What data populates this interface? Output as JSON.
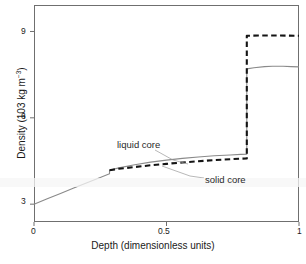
{
  "chart_data": {
    "type": "line",
    "title": "",
    "xlabel": "Depth (dimensionless units)",
    "ylabel_text": "Density (103 kg m",
    "ylabel_sup": "−3",
    "ylabel_tail": ")",
    "ylabel_full": "Density (103 kg m−3)",
    "xlim": [
      0,
      1
    ],
    "ylim": [
      2.38,
      9.92
    ],
    "xticks": [
      "0",
      "0.5",
      "1"
    ],
    "xtick_values": [
      0,
      0.5,
      1
    ],
    "yticks": [
      "3",
      "6",
      "9"
    ],
    "ytick_values": [
      3,
      6,
      9
    ],
    "grid": false,
    "legend_position": "inline-annotations",
    "annotations": [
      {
        "text": "liquid core",
        "points_to_series": "liquid core"
      },
      {
        "text": "solid core",
        "points_to_series": "solid core"
      }
    ],
    "series": [
      {
        "name": "liquid core",
        "style": "solid",
        "color": "#8a8a8a",
        "x": [
          0.0,
          0.05,
          0.1,
          0.15,
          0.2,
          0.25,
          0.285,
          0.285,
          0.32,
          0.38,
          0.44,
          0.5,
          0.56,
          0.62,
          0.68,
          0.74,
          0.78,
          0.803,
          0.803,
          0.83,
          0.87,
          0.9,
          0.94,
          0.97,
          1.0
        ],
        "y": [
          3.0,
          3.19,
          3.37,
          3.56,
          3.74,
          3.93,
          4.06,
          4.18,
          4.26,
          4.37,
          4.46,
          4.53,
          4.59,
          4.64,
          4.68,
          4.71,
          4.73,
          4.74,
          7.7,
          7.74,
          7.78,
          7.79,
          7.79,
          7.78,
          7.77
        ]
      },
      {
        "name": "solid core",
        "style": "dashed",
        "color": "#141414",
        "x": [
          0.285,
          0.32,
          0.38,
          0.44,
          0.5,
          0.56,
          0.62,
          0.68,
          0.74,
          0.78,
          0.803,
          0.803,
          0.86,
          0.92,
          1.0
        ],
        "y": [
          4.18,
          4.23,
          4.29,
          4.35,
          4.4,
          4.45,
          4.49,
          4.53,
          4.56,
          4.58,
          4.59,
          8.85,
          8.86,
          8.86,
          8.85
        ]
      }
    ]
  },
  "axis": {
    "y_tick_9": "9",
    "y_tick_6": "6",
    "y_tick_3": "3",
    "x_tick_0": "0",
    "x_tick_05": "0.5",
    "x_tick_1": "1",
    "x_title": "Depth (dimensionless units)",
    "y_title_main": "Density (103 kg m",
    "y_title_sup": "−3",
    "y_title_close": ")"
  },
  "labels": {
    "liquid_core": "liquid core",
    "solid_core": "solid core"
  },
  "colors": {
    "frame": "#6f6f6f",
    "liquid_curve": "#8a8a8a",
    "solid_curve": "#141414",
    "leader_line": "#9a9a9a",
    "text": "#1a1a1a",
    "background": "#ffffff"
  }
}
